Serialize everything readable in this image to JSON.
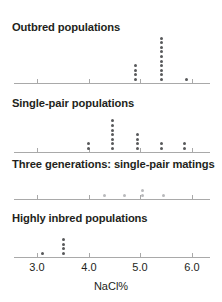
{
  "figure": {
    "width": 222,
    "height": 302,
    "axis_title": "NaCl%",
    "dot_color": "#58595b",
    "dot_color_light": "#b9babc",
    "axis_color": "#a9a9a9"
  },
  "chart_data": {
    "type": "scatter",
    "title": "",
    "xlabel": "NaCl%",
    "ylabel": "",
    "xlim": [
      2.55,
      6.35
    ],
    "grid": false,
    "legend": "none",
    "xticks": [
      3.0,
      4.0,
      5.0,
      6.0
    ],
    "xticklabels": [
      "3.0",
      "4.0",
      "5.0",
      "6.0"
    ],
    "panels": [
      {
        "label": "Outbred populations",
        "points": [
          {
            "x": 4.9,
            "count": 3,
            "shade": "dark"
          },
          {
            "x": 4.9,
            "count": 1,
            "shade": "dark",
            "gap": true
          },
          {
            "x": 5.4,
            "count": 10,
            "shade": "dark"
          },
          {
            "x": 5.9,
            "count": 1,
            "shade": "dark"
          }
        ],
        "stacks": [
          {
            "x": 4.9,
            "n": 4
          },
          {
            "x": 5.4,
            "n": 10
          },
          {
            "x": 5.9,
            "n": 1
          }
        ]
      },
      {
        "label": "Single-pair populations",
        "stacks": [
          {
            "x": 4.0,
            "n": 2
          },
          {
            "x": 4.45,
            "n": 7
          },
          {
            "x": 4.95,
            "n": 4
          },
          {
            "x": 5.4,
            "n": 2
          },
          {
            "x": 5.85,
            "n": 2
          }
        ]
      },
      {
        "label": "Three generations: single-pair matings",
        "shade": "light",
        "stacks": [
          {
            "x": 4.3,
            "n": 1
          },
          {
            "x": 4.7,
            "n": 1
          },
          {
            "x": 5.05,
            "n": 2
          },
          {
            "x": 5.45,
            "n": 1
          }
        ]
      },
      {
        "label": "Highly inbred populations",
        "stacks": [
          {
            "x": 3.1,
            "n": 1
          },
          {
            "x": 3.5,
            "n": 4
          }
        ]
      }
    ]
  }
}
